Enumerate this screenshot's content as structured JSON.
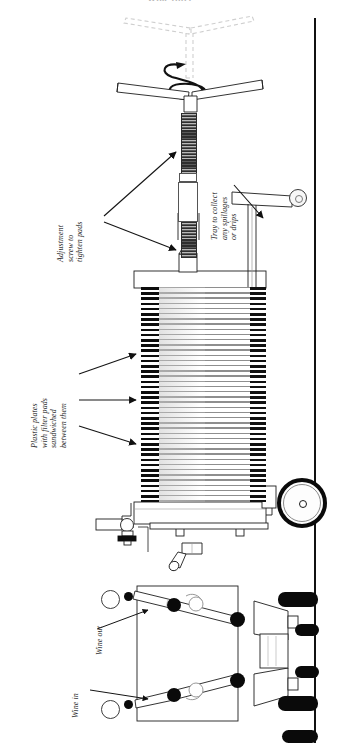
{
  "figure": {
    "title_cut_off": "Wine filter",
    "domain_note": "technical line diagram of a plate-and-frame wine filter press"
  },
  "labels": {
    "adjustment_screw": "Adjustment\nscrew to\ntighten pads",
    "tray": "Tray to collect\nany spillages\nor drips",
    "plastic_plates": "Plastic plates\nwith filter pads\nsandwiched\nbetween them",
    "wine_out": "Wine out",
    "wine_in": "Wine in"
  },
  "icons": {
    "rotation_arrow": "rotation-spiral-arrow",
    "handle": "t-handle",
    "handle_ghost": "t-handle-rotated-ghost",
    "screw": "threaded-screw-rod",
    "plate_stack": "filter-plate-stack",
    "wheel": "cart-wheel",
    "caster": "caster-wheel",
    "gauge": "pressure-gauge",
    "valve": "ball-valve",
    "hose": "hose",
    "ground": "ground-line"
  },
  "colors": {
    "line": "#1a1a1a",
    "plate_dark": "#0d0d0d",
    "plate_light": "#9d9d9d",
    "label_text": "#2b2b2b",
    "background": "#ffffff"
  }
}
